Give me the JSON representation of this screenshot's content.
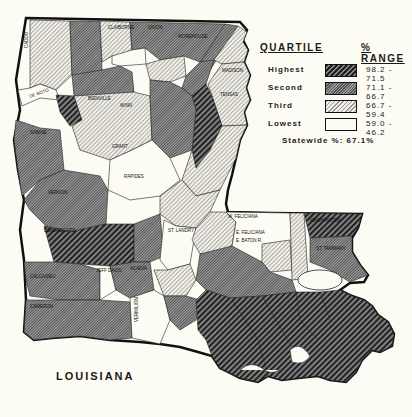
{
  "map": {
    "title": "LOUISIANA",
    "quartile_colors": {
      "highest": "#2b2b2b",
      "second": "#7a7a7a",
      "third": "#d8d6cc",
      "lowest": "#fdfcf4"
    },
    "parish_labels": [
      "CADDO",
      "BOSSIER",
      "WEBSTER",
      "CLAIBORNE",
      "UNION",
      "MOREHOUSE",
      "WEST CARROLL",
      "EAST CARROLL",
      "LINCOLN",
      "OUACHITA",
      "RICHLAND",
      "MADISON",
      "TENSAS",
      "DE SOTO",
      "RED RIVER",
      "BIENVILLE",
      "JACKSON",
      "WINN",
      "CALDWELL",
      "FRANKLIN",
      "SABINE",
      "NATCHITOCHES",
      "GRANT",
      "LA SALLE",
      "CATAHOULA",
      "CONCORDIA",
      "VERNON",
      "RAPIDES",
      "AVOYELLES",
      "BEAUREGARD",
      "ALLEN",
      "EVANGELINE",
      "ST. LANDRY",
      "W. FELICIANA",
      "E. FELICIANA",
      "ST. HELENA",
      "WASHINGTON",
      "W. BATON R.",
      "E. BATON R.",
      "LIVINGSTON",
      "TANGIPAHOA",
      "ST. TAMMANY",
      "POINTE COUPEE",
      "IBERVILLE",
      "CALCASIEU",
      "JEFF DAVIS",
      "ACADIA",
      "LAFAYETTE",
      "ST. MARTIN",
      "CAMERON",
      "VERMILION",
      "IBERIA",
      "ST. MARY",
      "ASSUMPTION",
      "ASCENSION",
      "ST. JAMES",
      "ST. JOHN",
      "ST. CHARLES",
      "LAFOURCHE",
      "TERREBONNE",
      "JEFFERSON",
      "ORLEANS",
      "ST. BERNARD",
      "PLAQUEMINES"
    ]
  },
  "legend": {
    "header_quartile": "QUARTILE",
    "header_range": "% RANGE",
    "rows": [
      {
        "key": "highest",
        "label": "Highest",
        "range": "98.2 - 71.5"
      },
      {
        "key": "second",
        "label": "Second",
        "range": "71.1 - 66.7"
      },
      {
        "key": "third",
        "label": "Third",
        "range": "66.7 - 59.4"
      },
      {
        "key": "lowest",
        "label": "Lowest",
        "range": "59.0 - 46.2"
      }
    ],
    "statewide": "Statewide %: 67.1%"
  }
}
